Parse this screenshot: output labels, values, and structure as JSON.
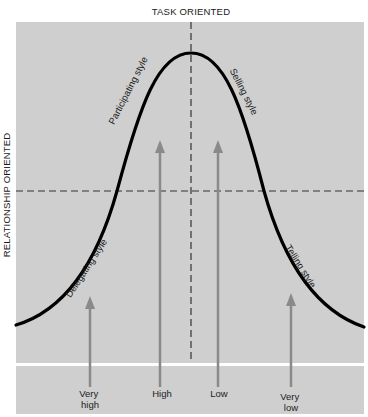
{
  "diagram": {
    "axes": {
      "vertical_label": "TASK ORIENTED",
      "horizontal_label": "RELATIONSHIP ORIENTED"
    },
    "styles": [
      {
        "id": "participating",
        "label": "Participating style"
      },
      {
        "id": "selling",
        "label": "Selling style"
      },
      {
        "id": "delegating",
        "label": "Delegating style"
      },
      {
        "id": "telling",
        "label": "Telling style"
      }
    ],
    "maturity_levels": [
      {
        "id": "very-high",
        "lines": [
          "Very",
          "high"
        ]
      },
      {
        "id": "high",
        "lines": [
          "High"
        ]
      },
      {
        "id": "low",
        "lines": [
          "Low"
        ]
      },
      {
        "id": "very-low",
        "lines": [
          "Very",
          "low"
        ]
      }
    ],
    "colors": {
      "panel": "#cfcfcf",
      "curve": "#000000",
      "arrow": "#8a8a8a",
      "dash": "#333333",
      "separator": "#ffffff"
    }
  }
}
